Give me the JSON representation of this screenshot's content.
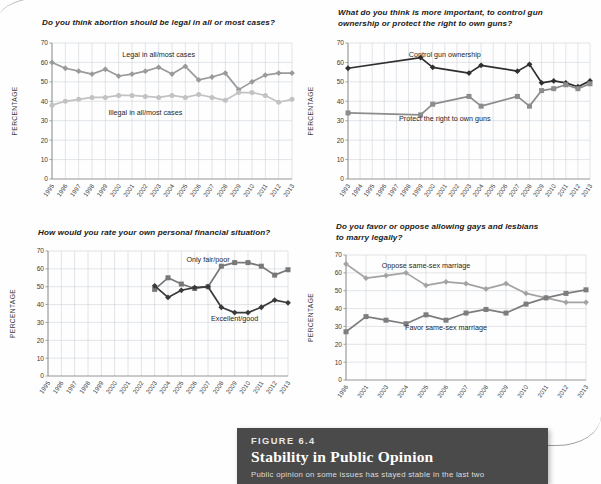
{
  "figure": {
    "kicker": "FIGURE 6.4",
    "title": "Stability in Public Opinion",
    "body": "Public opinion on some issues has stayed stable in the last two"
  },
  "axis": {
    "ylabel": "PERCENTAGE",
    "yticks": [
      "0",
      "10",
      "20",
      "30",
      "40",
      "50",
      "60",
      "70"
    ]
  },
  "chart_data": [
    {
      "id": "abortion",
      "type": "line",
      "title": "Do you think abortion should be legal in all or most cases?",
      "xlabel": "",
      "ylabel": "PERCENTAGE",
      "ylim": [
        0,
        70
      ],
      "grid": true,
      "legend": "inline-annotations",
      "categories": [
        "1995",
        "1996",
        "1997",
        "1998",
        "1999",
        "2000",
        "2001",
        "2002",
        "2003",
        "2004",
        "2005",
        "2006",
        "2007",
        "2008",
        "2009",
        "2010",
        "2011",
        "2012",
        "2013"
      ],
      "series": [
        {
          "name": "Legal in all/most cases",
          "color": "#9a9a9a",
          "marker": "diamond",
          "values": [
            60,
            57,
            55.5,
            54,
            56.5,
            53,
            54,
            55.5,
            57.5,
            54,
            58,
            51,
            52.5,
            54.5,
            46,
            50,
            53.5,
            54.5,
            54.5
          ]
        },
        {
          "name": "Illegal in all/most cases",
          "color": "#c2c2c2",
          "marker": "circle",
          "values": [
            38,
            40,
            41,
            42,
            42,
            43,
            43,
            42.5,
            42,
            43,
            42,
            43.5,
            42,
            40.5,
            44.5,
            44.5,
            43,
            39.5,
            41
          ]
        }
      ],
      "annotations": [
        {
          "text": "Legal in all/most cases",
          "x": 2003,
          "y": 63
        },
        {
          "text": "Illegal in all/most cases",
          "x": 2002,
          "y": 33
        }
      ]
    },
    {
      "id": "guns",
      "type": "line",
      "title": "What do you think is more important, to control gun ownership or protect the right to own guns?",
      "xlabel": "",
      "ylabel": "PERCENTAGE",
      "ylim": [
        0,
        70
      ],
      "grid": true,
      "legend": "inline-annotations",
      "categories": [
        "1993",
        "1994",
        "1995",
        "1996",
        "1997",
        "1998",
        "1999",
        "2000",
        "2001",
        "2002",
        "2003",
        "2004",
        "2005",
        "2006",
        "2007",
        "2008",
        "2009",
        "2010",
        "2011",
        "2012",
        "2013"
      ],
      "series": [
        {
          "name": "Control gun ownership",
          "color": "#2f2f2f",
          "marker": "diamond",
          "values": [
            57,
            null,
            null,
            null,
            null,
            null,
            62.5,
            57.5,
            null,
            null,
            54.5,
            58.5,
            null,
            null,
            55.5,
            59,
            49.5,
            50.5,
            49.5,
            47.5,
            50.5
          ]
        },
        {
          "name": "Protect the right to own guns",
          "color": "#8c8c8c",
          "marker": "square",
          "values": [
            34,
            null,
            null,
            null,
            null,
            null,
            33,
            38.5,
            null,
            null,
            42.5,
            37.5,
            null,
            null,
            42.5,
            37.5,
            45.5,
            46.5,
            48.5,
            46.5,
            49
          ]
        }
      ],
      "annotations": [
        {
          "text": "Control gun ownership",
          "x": 2001,
          "y": 63
        },
        {
          "text": "Protect the right to own guns",
          "x": 2001,
          "y": 30
        }
      ]
    },
    {
      "id": "finances",
      "type": "line",
      "title": "How would you rate your own personal financial situation?",
      "xlabel": "",
      "ylabel": "PERCENTAGE",
      "ylim": [
        0,
        70
      ],
      "grid": true,
      "legend": "inline-annotations",
      "categories": [
        "1995",
        "1996",
        "1997",
        "1998",
        "1999",
        "2000",
        "2001",
        "2002",
        "2003",
        "2004",
        "2005",
        "2006",
        "2007",
        "2008",
        "2009",
        "2010",
        "2011",
        "2012",
        "2013"
      ],
      "series": [
        {
          "name": "Only fair/poor",
          "color": "#787878",
          "marker": "square",
          "values": [
            null,
            null,
            null,
            null,
            null,
            null,
            null,
            null,
            48.5,
            55,
            51.5,
            49,
            50,
            61.5,
            63.5,
            63.5,
            61.5,
            56.5,
            59.5
          ]
        },
        {
          "name": "Excellent/good",
          "color": "#3a3a3a",
          "marker": "diamond",
          "values": [
            null,
            null,
            null,
            null,
            null,
            null,
            null,
            null,
            50.5,
            44,
            48,
            49.5,
            50,
            38.5,
            35.5,
            35.5,
            38.5,
            42.5,
            41
          ]
        }
      ],
      "annotations": [
        {
          "text": "Only fair/poor",
          "x": 2007,
          "y": 64
        },
        {
          "text": "Excellent/good",
          "x": 2009,
          "y": 31
        }
      ]
    },
    {
      "id": "same-sex-marriage",
      "type": "line",
      "title": "Do you favor or oppose allowing gays and lesbians to marry legally?",
      "xlabel": "",
      "ylabel": "PERCENTAGE",
      "ylim": [
        0,
        70
      ],
      "grid": true,
      "legend": "inline-annotations",
      "categories": [
        "1996",
        "2001",
        "2003",
        "2004",
        "2005",
        "2006",
        "2007",
        "2008",
        "2009",
        "2010",
        "2011",
        "2012",
        "2013"
      ],
      "series": [
        {
          "name": "Oppose same-sex marriage",
          "color": "#a3a3a3",
          "marker": "diamond",
          "values": [
            65,
            57,
            58.5,
            60,
            53,
            55,
            54,
            51,
            54,
            48.5,
            46,
            43.5,
            43.5
          ]
        },
        {
          "name": "Favor same-sex marriage",
          "color": "#7d7d7d",
          "marker": "square",
          "values": [
            27,
            35.5,
            33.5,
            31.5,
            36.5,
            33.5,
            37.5,
            39.5,
            37.5,
            42.5,
            46,
            48.5,
            50.5
          ]
        }
      ],
      "annotations": [
        {
          "text": "Oppose same-sex marriage",
          "x": 2005,
          "y": 63
        },
        {
          "text": "Favor same-sex marriage",
          "x": 2006,
          "y": 28
        }
      ]
    }
  ]
}
